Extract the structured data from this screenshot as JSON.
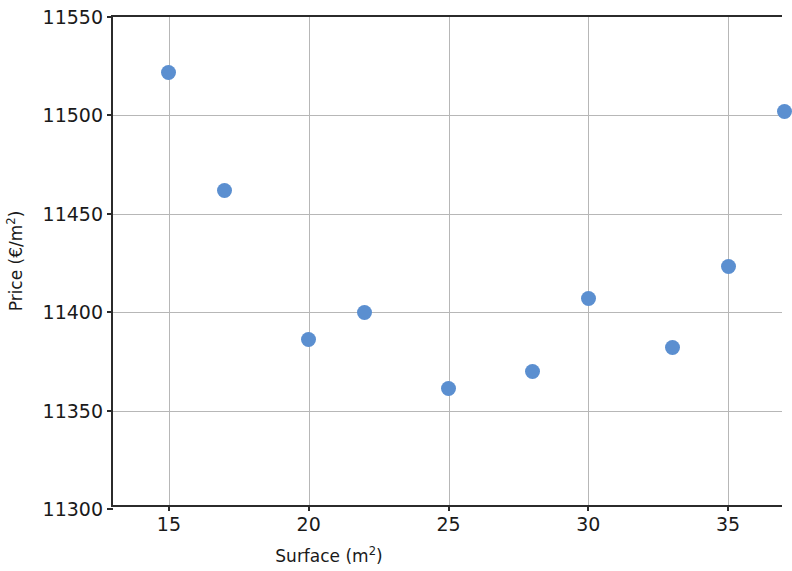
{
  "chart_data": {
    "type": "scatter",
    "title": "",
    "xlabel": "Surface (m²)",
    "ylabel": "Price (€/m²)",
    "x": [
      15,
      17,
      20,
      22,
      25,
      28,
      30,
      33,
      35,
      37
    ],
    "y": [
      11522,
      11462,
      11386,
      11400,
      11361,
      11370,
      11407,
      11382,
      11423,
      11502
    ],
    "points": [
      {
        "x": 15,
        "y": 11522
      },
      {
        "x": 17,
        "y": 11462
      },
      {
        "x": 20,
        "y": 11386
      },
      {
        "x": 22,
        "y": 11400
      },
      {
        "x": 25,
        "y": 11361
      },
      {
        "x": 28,
        "y": 11370
      },
      {
        "x": 30,
        "y": 11407
      },
      {
        "x": 33,
        "y": 11382
      },
      {
        "x": 35,
        "y": 11423
      },
      {
        "x": 37,
        "y": 11502
      }
    ],
    "xlim": [
      13.0,
      37.0
    ],
    "ylim": [
      11300,
      11550
    ],
    "xticks": [
      15,
      20,
      25,
      30,
      35
    ],
    "xtick_labels": [
      "15",
      "20",
      "25",
      "30",
      "35"
    ],
    "yticks": [
      11300,
      11350,
      11400,
      11450,
      11500,
      11550
    ],
    "ytick_labels": [
      "11300",
      "11350",
      "11400",
      "11450",
      "11500",
      "11550"
    ],
    "grid": true,
    "grid_color": "#b7b7b7",
    "legend": null,
    "marker_color": "#5b8fd0",
    "marker_size": 15,
    "axis_color": "#2b2b2b",
    "background": "#ffffff"
  }
}
